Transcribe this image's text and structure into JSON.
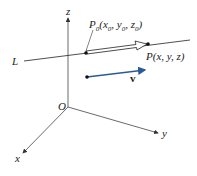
{
  "diagram": {
    "labels": {
      "line": "L",
      "origin": "O",
      "x_axis": "x",
      "y_axis": "y",
      "z_axis": "z",
      "p0_main": "P",
      "p0_sub": "0",
      "p0_coords_open": "(x",
      "p0_comma1": ", y",
      "p0_comma2": ", z",
      "p0_close": ")",
      "p_point": "P(x, y, z)",
      "vector": "v"
    },
    "colors": {
      "axes": "#333333",
      "line": "#222222",
      "vector": "#2a5a9a",
      "points": "#111111"
    }
  }
}
